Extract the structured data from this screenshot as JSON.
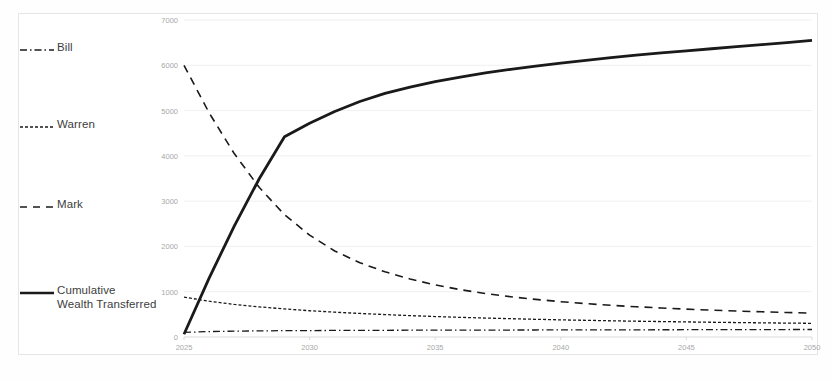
{
  "chart_data": {
    "type": "line",
    "title": "",
    "subtitle": "",
    "xlabel": "",
    "ylabel": "",
    "xlim": [
      2025,
      2050
    ],
    "ylim": [
      0,
      7000
    ],
    "grid": true,
    "legend_position": "left-outside",
    "x_ticks": [
      "2025",
      "2030",
      "2035",
      "2040",
      "2045",
      "2050"
    ],
    "y_ticks": [
      "0",
      "1000",
      "2000",
      "3000",
      "4000",
      "5000",
      "6000",
      "7000"
    ],
    "x": [
      2025,
      2026,
      2027,
      2028,
      2029,
      2030,
      2031,
      2032,
      2033,
      2034,
      2035,
      2036,
      2037,
      2038,
      2039,
      2040,
      2041,
      2042,
      2043,
      2044,
      2045,
      2046,
      2047,
      2048,
      2049,
      2050
    ],
    "series": [
      {
        "name": "Bill",
        "style": "dash-dot",
        "values": [
          100,
          120,
          130,
          135,
          140,
          142,
          145,
          147,
          148,
          150,
          151,
          152,
          153,
          154,
          155,
          156,
          157,
          158,
          159,
          160,
          161,
          162,
          163,
          164,
          165,
          166
        ]
      },
      {
        "name": "Warren",
        "style": "fine-dash",
        "values": [
          880,
          790,
          720,
          665,
          620,
          580,
          548,
          520,
          495,
          472,
          452,
          434,
          418,
          404,
          391,
          379,
          368,
          358,
          349,
          341,
          333,
          326,
          319,
          313,
          307,
          302
        ]
      },
      {
        "name": "Mark",
        "style": "long-dash",
        "values": [
          6000,
          4950,
          4050,
          3300,
          2700,
          2250,
          1900,
          1640,
          1440,
          1280,
          1150,
          1045,
          960,
          890,
          830,
          780,
          737,
          700,
          668,
          640,
          615,
          593,
          574,
          557,
          541,
          527
        ]
      },
      {
        "name": "Cumulative Wealth Transferred",
        "style": "solid-thick",
        "values": [
          60,
          1300,
          2450,
          3500,
          4420,
          4720,
          4980,
          5200,
          5380,
          5520,
          5640,
          5740,
          5830,
          5910,
          5980,
          6050,
          6110,
          6170,
          6225,
          6275,
          6320,
          6365,
          6410,
          6455,
          6500,
          6550
        ]
      }
    ]
  },
  "legend": {
    "items": [
      {
        "label": "Bill",
        "style": "dash-dot"
      },
      {
        "label": "Warren",
        "style": "fine-dash"
      },
      {
        "label": "Mark",
        "style": "long-dash"
      },
      {
        "label": "Cumulative\nWealth Transferred",
        "style": "solid-thick"
      }
    ]
  }
}
